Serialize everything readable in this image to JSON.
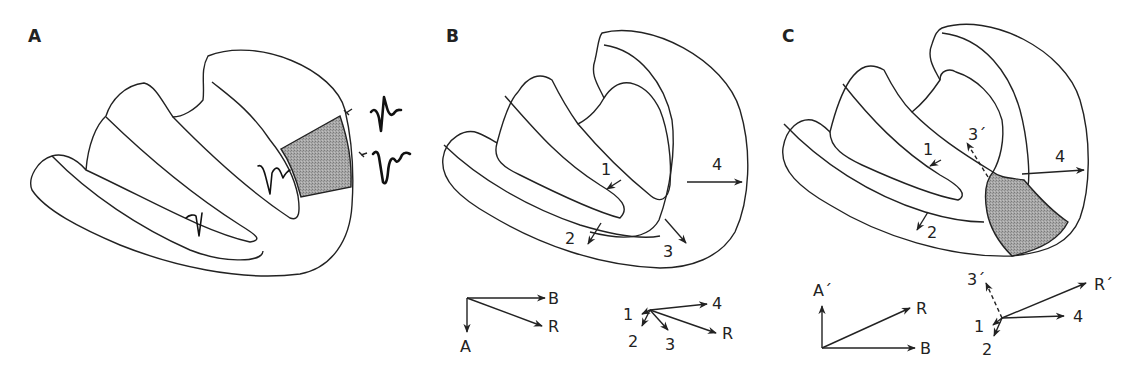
{
  "panels": {
    "a": {
      "label": "A",
      "description": "Cross-section of heart with shaded lateral wall region; recorded electrograms shown",
      "electrograms": [
        "endocardial-rS-like",
        "epicardial-upper",
        "epicardial-lower-QS"
      ]
    },
    "b": {
      "label": "B",
      "wall_vectors": {
        "v1": "1",
        "v2": "2",
        "v3": "3",
        "v4": "4"
      },
      "summary_vectors": {
        "A": "A",
        "B": "B",
        "R": "R"
      },
      "summation": {
        "v1": "1",
        "v2": "2",
        "v3": "3",
        "v4": "4",
        "R": "R"
      }
    },
    "c": {
      "label": "C",
      "wall_vectors": {
        "v1": "1",
        "v2": "2",
        "v3p": "3´",
        "v4": "4"
      },
      "summary_vectors": {
        "Ap": "A´",
        "R": "R",
        "B": "B"
      },
      "summation": {
        "v3p": "3´",
        "Rp": "R´",
        "v1": "1",
        "v4": "4",
        "v2": "2"
      }
    }
  },
  "colors": {
    "stroke": "#222222",
    "shade": "#9a9a9a",
    "background": "#ffffff"
  }
}
